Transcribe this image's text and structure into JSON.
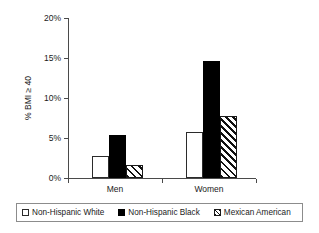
{
  "chart_data": {
    "type": "bar",
    "title": "",
    "xlabel": "",
    "ylabel": "% BMI ≥ 40",
    "ylim": [
      0,
      20
    ],
    "ytick_labels": [
      "0%",
      "5%",
      "10%",
      "15%",
      "20%"
    ],
    "ytick_values": [
      0,
      5,
      10,
      15,
      20
    ],
    "grid": false,
    "legend_position": "bottom",
    "categories": [
      "Men",
      "Women"
    ],
    "series": [
      {
        "name": "Non-Hispanic White",
        "style": "white",
        "values": [
          2.8,
          5.7
        ]
      },
      {
        "name": "Non-Hispanic Black",
        "style": "black",
        "values": [
          5.4,
          14.6
        ]
      },
      {
        "name": "Mexican American",
        "style": "hatch",
        "values": [
          1.6,
          7.8
        ]
      }
    ]
  },
  "legend": {
    "entries": [
      {
        "label": "Non-Hispanic White"
      },
      {
        "label": "Non-Hispanic Black"
      },
      {
        "label": "Mexican American"
      }
    ]
  },
  "colors": {
    "axis": "#4a4a4a",
    "text": "#1a1a1a",
    "bar_white": "#ffffff",
    "bar_black": "#000000",
    "bar_hatch": "#111111",
    "legend_border": "#8c8c8c",
    "background": "#ffffff"
  }
}
